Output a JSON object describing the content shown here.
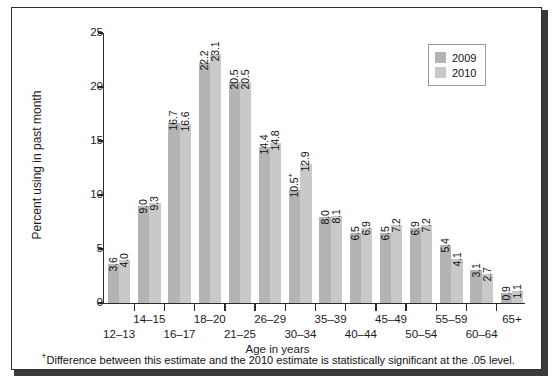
{
  "chart_data": {
    "type": "bar",
    "title": "",
    "xlabel": "Age in years",
    "ylabel": "Percent using in past month",
    "ylim": [
      0,
      25
    ],
    "yticks": [
      "0",
      "5",
      "10",
      "15",
      "20",
      "25"
    ],
    "grid": false,
    "legend_position": "top-right",
    "categories": [
      "12–13",
      "14–15",
      "16–17",
      "18–20",
      "21–25",
      "26–29",
      "30–34",
      "35–39",
      "40–44",
      "45–49",
      "50–54",
      "55–59",
      "60–64",
      "65+"
    ],
    "series": [
      {
        "name": "2009",
        "color": "#b4b4b4",
        "values": [
          3.6,
          9.0,
          16.7,
          22.2,
          20.5,
          14.4,
          10.5,
          8.0,
          6.5,
          6.5,
          6.9,
          5.4,
          3.1,
          0.9
        ],
        "labels": [
          "3.6",
          "9.0",
          "16.7",
          "22.2",
          "20.5",
          "14.4",
          "10.5⁺",
          "8.0",
          "6.5",
          "6.5",
          "6.9",
          "5.4",
          "3.1",
          "0.9"
        ],
        "significant": [
          false,
          false,
          false,
          false,
          false,
          false,
          true,
          false,
          false,
          false,
          false,
          false,
          false,
          false
        ]
      },
      {
        "name": "2010",
        "color": "#c9c9c9",
        "values": [
          4.0,
          9.3,
          16.6,
          23.1,
          20.5,
          14.8,
          12.9,
          8.1,
          6.9,
          7.2,
          7.2,
          4.1,
          2.7,
          1.1
        ],
        "labels": [
          "4.0",
          "9.3",
          "16.6",
          "23.1",
          "20.5",
          "14.8",
          "12.9",
          "8.1",
          "6.9",
          "7.2",
          "7.2",
          "4.1",
          "2.7",
          "1.1"
        ],
        "significant": [
          false,
          false,
          false,
          false,
          false,
          false,
          false,
          false,
          false,
          false,
          false,
          false,
          false,
          false
        ]
      }
    ]
  },
  "legend": {
    "items": [
      {
        "label": "2009",
        "color": "#b4b4b4"
      },
      {
        "label": "2010",
        "color": "#c9c9c9"
      }
    ]
  },
  "footnote": {
    "marker": "+",
    "text": "Difference between this estimate and the 2010 estimate is statistically significant at the .05 level."
  }
}
